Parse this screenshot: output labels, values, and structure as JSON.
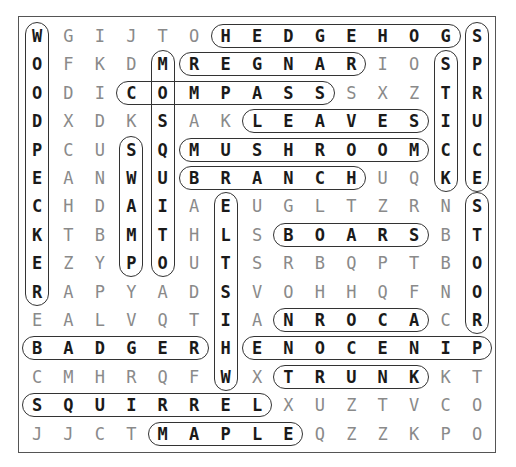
{
  "puzzle": {
    "rows": 15,
    "cols": 15,
    "grid": [
      [
        "W",
        "G",
        "I",
        "J",
        "T",
        "O",
        "H",
        "E",
        "D",
        "G",
        "E",
        "H",
        "O",
        "G",
        "S"
      ],
      [
        "O",
        "F",
        "K",
        "D",
        "M",
        "R",
        "E",
        "G",
        "N",
        "A",
        "R",
        "I",
        "O",
        "S",
        "P"
      ],
      [
        "O",
        "D",
        "I",
        "C",
        "O",
        "M",
        "P",
        "A",
        "S",
        "S",
        "S",
        "X",
        "Z",
        "T",
        "R"
      ],
      [
        "D",
        "X",
        "D",
        "K",
        "S",
        "A",
        "K",
        "L",
        "E",
        "A",
        "V",
        "E",
        "S",
        "I",
        "U"
      ],
      [
        "P",
        "C",
        "U",
        "S",
        "Q",
        "M",
        "U",
        "S",
        "H",
        "R",
        "O",
        "O",
        "M",
        "C",
        "C"
      ],
      [
        "E",
        "A",
        "N",
        "W",
        "U",
        "B",
        "R",
        "A",
        "N",
        "C",
        "H",
        "U",
        "Q",
        "K",
        "E"
      ],
      [
        "C",
        "H",
        "D",
        "A",
        "I",
        "A",
        "E",
        "U",
        "G",
        "L",
        "T",
        "Z",
        "R",
        "N",
        "S"
      ],
      [
        "K",
        "T",
        "B",
        "M",
        "T",
        "H",
        "L",
        "S",
        "B",
        "O",
        "A",
        "R",
        "S",
        "B",
        "T"
      ],
      [
        "E",
        "Z",
        "Y",
        "P",
        "O",
        "U",
        "T",
        "S",
        "R",
        "B",
        "Q",
        "P",
        "T",
        "B",
        "O"
      ],
      [
        "R",
        "A",
        "P",
        "Y",
        "A",
        "D",
        "S",
        "V",
        "O",
        "H",
        "H",
        "Q",
        "F",
        "N",
        "O"
      ],
      [
        "E",
        "A",
        "L",
        "V",
        "Q",
        "T",
        "I",
        "A",
        "N",
        "R",
        "O",
        "C",
        "A",
        "C",
        "R"
      ],
      [
        "B",
        "A",
        "D",
        "G",
        "E",
        "R",
        "H",
        "E",
        "N",
        "O",
        "C",
        "E",
        "N",
        "I",
        "P"
      ],
      [
        "C",
        "M",
        "H",
        "R",
        "Q",
        "F",
        "W",
        "X",
        "T",
        "R",
        "U",
        "N",
        "K",
        "K",
        "T"
      ],
      [
        "S",
        "Q",
        "U",
        "I",
        "R",
        "R",
        "E",
        "L",
        "X",
        "U",
        "Z",
        "T",
        "V",
        "C",
        "O"
      ],
      [
        "J",
        "J",
        "C",
        "T",
        "M",
        "A",
        "P",
        "L",
        "E",
        "Q",
        "Z",
        "Z",
        "K",
        "P",
        "O"
      ]
    ],
    "found_words": [
      {
        "word": "HEDGEHOG",
        "row": 0,
        "col": 6,
        "dir": "h",
        "len": 8
      },
      {
        "word": "REGNAR",
        "row": 1,
        "col": 5,
        "dir": "h",
        "len": 6
      },
      {
        "word": "COMPASS",
        "row": 2,
        "col": 3,
        "dir": "h",
        "len": 7
      },
      {
        "word": "LEAVES",
        "row": 3,
        "col": 7,
        "dir": "h",
        "len": 6
      },
      {
        "word": "MUSHROOM",
        "row": 4,
        "col": 5,
        "dir": "h",
        "len": 8
      },
      {
        "word": "BRANCH",
        "row": 5,
        "col": 5,
        "dir": "h",
        "len": 6
      },
      {
        "word": "BOARS",
        "row": 7,
        "col": 8,
        "dir": "h",
        "len": 5
      },
      {
        "word": "NROCA",
        "row": 10,
        "col": 8,
        "dir": "h",
        "len": 5
      },
      {
        "word": "BADGER",
        "row": 11,
        "col": 0,
        "dir": "h",
        "len": 6
      },
      {
        "word": "ENOCENIP",
        "row": 11,
        "col": 7,
        "dir": "h",
        "len": 8
      },
      {
        "word": "TRUNK",
        "row": 12,
        "col": 8,
        "dir": "h",
        "len": 5
      },
      {
        "word": "SQUIRREL",
        "row": 13,
        "col": 0,
        "dir": "h",
        "len": 8
      },
      {
        "word": "MAPLE",
        "row": 14,
        "col": 4,
        "dir": "h",
        "len": 5
      },
      {
        "word": "WOODPECKER",
        "row": 0,
        "col": 0,
        "dir": "v",
        "len": 10
      },
      {
        "word": "MOSQUITO",
        "row": 1,
        "col": 4,
        "dir": "v",
        "len": 8
      },
      {
        "word": "SWAMP",
        "row": 4,
        "col": 3,
        "dir": "v",
        "len": 5
      },
      {
        "word": "ELTSIHW",
        "row": 6,
        "col": 6,
        "dir": "v",
        "len": 7
      },
      {
        "word": "STICK",
        "row": 1,
        "col": 13,
        "dir": "v",
        "len": 5
      },
      {
        "word": "SPRUCE",
        "row": 0,
        "col": 14,
        "dir": "v",
        "len": 6
      },
      {
        "word": "STOOR",
        "row": 6,
        "col": 14,
        "dir": "v",
        "len": 5
      }
    ]
  },
  "colors": {
    "frame": "#555555",
    "found_letter": "#1a1a1a",
    "unfound_letter": "#8a8a8a",
    "pill_border": "#333333"
  }
}
